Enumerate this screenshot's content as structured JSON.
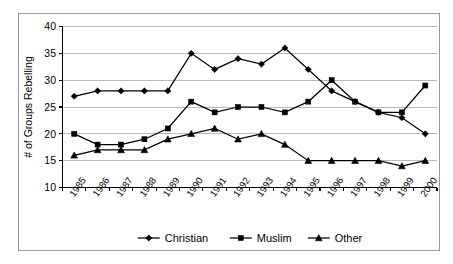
{
  "chart_data": {
    "type": "line",
    "title": "",
    "xlabel": "",
    "ylabel": "# of Groups Rebelling",
    "categories": [
      "1985",
      "1986",
      "1987",
      "1988",
      "1989",
      "1990",
      "1991",
      "1992",
      "1993",
      "1994",
      "1995",
      "1996",
      "1997",
      "1998",
      "1999",
      "2000"
    ],
    "x_tick_labels": [
      "1985",
      "1986",
      "1987",
      "1988",
      "1989",
      "1990",
      "1991",
      "1992",
      "1993",
      "1994",
      "1995",
      "1996",
      "1997",
      "1998",
      "1999",
      "2000"
    ],
    "y_tick_labels": [
      "10",
      "15",
      "20",
      "25",
      "30",
      "35",
      "40"
    ],
    "y_ticks": [
      10,
      15,
      20,
      25,
      30,
      35,
      40
    ],
    "ylim": [
      10,
      40
    ],
    "grid": "horizontal",
    "legend_position": "bottom",
    "series": [
      {
        "name": "Christian",
        "marker": "diamond",
        "color": "#000000",
        "values": [
          27,
          28,
          28,
          28,
          28,
          35,
          32,
          34,
          33,
          36,
          32,
          28,
          26,
          24,
          23,
          20
        ]
      },
      {
        "name": "Muslim",
        "marker": "square",
        "color": "#000000",
        "values": [
          20,
          18,
          18,
          19,
          21,
          26,
          24,
          25,
          25,
          24,
          26,
          30,
          26,
          24,
          24,
          29
        ]
      },
      {
        "name": "Other",
        "marker": "triangle",
        "color": "#000000",
        "values": [
          16,
          17,
          17,
          17,
          19,
          20,
          21,
          19,
          20,
          18,
          15,
          15,
          15,
          15,
          14,
          15
        ]
      }
    ]
  },
  "legend": {
    "items": [
      {
        "label": "Christian"
      },
      {
        "label": "Muslim"
      },
      {
        "label": "Other"
      }
    ]
  },
  "axes": {
    "y_axis_title": "# of Groups Rebelling"
  }
}
